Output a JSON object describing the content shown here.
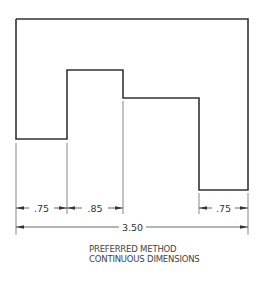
{
  "drawing": {
    "outline_color": "#333333",
    "dim_color": "#444444",
    "outline": [
      [
        16,
        19
      ],
      [
        248,
        19
      ],
      [
        248,
        190
      ],
      [
        199,
        190
      ],
      [
        199,
        98
      ],
      [
        123,
        98
      ],
      [
        123,
        70
      ],
      [
        67,
        70
      ],
      [
        67,
        139
      ],
      [
        16,
        139
      ],
      [
        16,
        19
      ]
    ],
    "dimensions": [
      {
        "label": ".75",
        "x1": 16,
        "x2": 67,
        "y": 208
      },
      {
        "label": ".85",
        "x1": 67,
        "x2": 123,
        "y": 208
      },
      {
        "label": ".75",
        "x1": 199,
        "x2": 248,
        "y": 208
      },
      {
        "label": "3.50",
        "x1": 16,
        "x2": 248,
        "y": 227
      }
    ]
  },
  "caption": {
    "line1": "PREFERRED METHOD",
    "line2": "CONTINUOUS DIMENSIONS"
  }
}
